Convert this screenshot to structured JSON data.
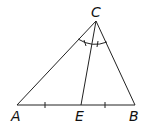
{
  "diagram": {
    "type": "triangle",
    "points": {
      "A": {
        "label": "A",
        "x": 17,
        "y": 105
      },
      "B": {
        "label": "B",
        "x": 135,
        "y": 105
      },
      "C": {
        "label": "C",
        "x": 96,
        "y": 21
      },
      "E": {
        "label": "E",
        "x": 81,
        "y": 105
      }
    },
    "segments": [
      "AB",
      "AC",
      "BC",
      "CE"
    ],
    "marks": {
      "equal_segments": [
        "AE",
        "EB"
      ],
      "equal_angles": [
        "ACE",
        "ECB"
      ]
    },
    "colors": {
      "stroke": "#222222",
      "background": "#ffffff"
    }
  }
}
